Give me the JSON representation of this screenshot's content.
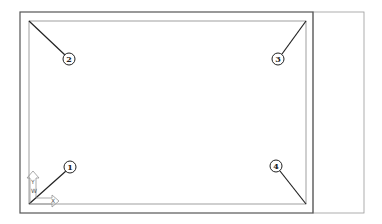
{
  "diagram": {
    "colors": {
      "line": "#333333",
      "frame": "#777777",
      "panel": "#999999",
      "background": "#ffffff"
    },
    "callouts": [
      {
        "number": "1",
        "position": "bottom-left"
      },
      {
        "number": "2",
        "position": "top-left"
      },
      {
        "number": "3",
        "position": "top-right"
      },
      {
        "number": "4",
        "position": "bottom-right"
      }
    ],
    "ucs_icon": {
      "x_label": "X",
      "y_label": "Y",
      "w_label": "W"
    }
  }
}
